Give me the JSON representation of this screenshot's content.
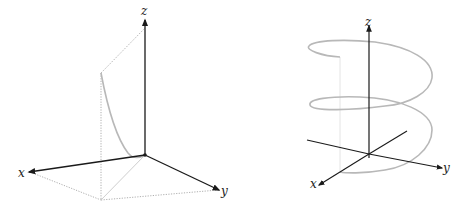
{
  "figure": {
    "panels": [
      {
        "id": "left",
        "description": "Curve on a vertical plane with dotted projection box",
        "axes": {
          "x_label": "x",
          "y_label": "y",
          "z_label": "z"
        }
      },
      {
        "id": "right",
        "description": "Helix around the z-axis",
        "axes": {
          "x_label": "x",
          "y_label": "y",
          "z_label": "z"
        }
      }
    ],
    "colors": {
      "axis": "#1a1a1a",
      "curve": "#b8b8b8",
      "dotted": "#9a9a9a",
      "guide": "#e0e0e0"
    }
  }
}
